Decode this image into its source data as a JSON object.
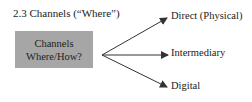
{
  "heading": "2.3 Channels (“Where”)",
  "source_box": {
    "line1": "Channels",
    "line2": "Where/How?",
    "fill": "#a6a6a6"
  },
  "targets": [
    {
      "label": "Direct (Physical)"
    },
    {
      "label": "Intermediary"
    },
    {
      "label": "Digital"
    }
  ],
  "arrow_color": "#333333"
}
